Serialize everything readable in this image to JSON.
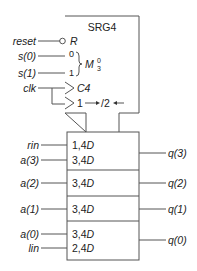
{
  "diagram": {
    "title": "SRG4",
    "colors": {
      "line": "#555555",
      "text": "#222222",
      "background": "#ffffff"
    },
    "control_block": {
      "reset_qualifier": "R",
      "mode_select_inputs": [
        "0",
        "1"
      ],
      "mode_label": "M",
      "mode_superscript": "0",
      "mode_subscript": "3",
      "clock_label": "C4",
      "shift_label_left": "1",
      "shift_arrow_right": "→",
      "shift_label_right": "/2",
      "shift_arrow_left": "←"
    },
    "inputs": {
      "reset": "reset",
      "s0": "s(0)",
      "s1": "s(1)",
      "clk": "clk",
      "rin": "rin",
      "a3": "a(3)",
      "a2": "a(2)",
      "a1": "a(1)",
      "a0": "a(0)",
      "lin": "lin"
    },
    "cells": [
      {
        "lines": [
          "1,4",
          "3,4"
        ],
        "suffix": "D",
        "output": "q(3)"
      },
      {
        "lines": [
          "3,4"
        ],
        "suffix": "D",
        "output": "q(2)"
      },
      {
        "lines": [
          "3,4"
        ],
        "suffix": "D",
        "output": "q(1)"
      },
      {
        "lines": [
          "3,4",
          "2,4"
        ],
        "suffix": "D",
        "output": "q(0)"
      }
    ]
  }
}
